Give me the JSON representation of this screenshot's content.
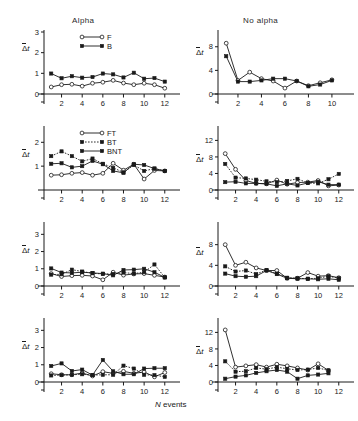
{
  "figure": {
    "column_titles": [
      "Alpha",
      "No alpha"
    ],
    "xaxis_title_symbol": "N",
    "xaxis_title_text": " events",
    "ylabel_delta": "Δ",
    "ylabel_t": "t"
  },
  "legends": {
    "top": [
      {
        "label": "F",
        "marker": "open-circle",
        "line": "solid"
      },
      {
        "label": "B",
        "marker": "filled-square",
        "line": "solid"
      }
    ],
    "second": [
      {
        "label": "FT",
        "marker": "open-circle",
        "line": "solid"
      },
      {
        "label": "BT",
        "marker": "filled-square",
        "line": "dotted"
      },
      {
        "label": "BNT",
        "marker": "filled-square",
        "line": "solid"
      }
    ]
  },
  "chart_data": [
    {
      "id": "alpha-row1",
      "type": "line",
      "title": "Alpha",
      "xlabel": "N events",
      "ylabel": "Δt",
      "xlim": [
        0.3,
        12.7
      ],
      "ylim": [
        0,
        3
      ],
      "xticks": [
        2,
        4,
        6,
        8,
        10,
        12
      ],
      "yticks": [
        0,
        1,
        2,
        3
      ],
      "grid": false,
      "legend": "top",
      "x": [
        1,
        2,
        3,
        4,
        5,
        6,
        7,
        8,
        9,
        10,
        11,
        12
      ],
      "series": [
        {
          "name": "F",
          "marker": "open-circle",
          "line": "solid",
          "values": [
            0.34,
            0.45,
            0.47,
            0.38,
            0.52,
            0.57,
            0.66,
            0.53,
            0.45,
            0.52,
            0.45,
            0.28
          ]
        },
        {
          "name": "B",
          "marker": "filled-square",
          "line": "solid",
          "values": [
            0.99,
            0.76,
            0.86,
            0.79,
            0.82,
            0.99,
            0.95,
            0.8,
            1.03,
            0.74,
            0.77,
            0.6
          ]
        }
      ]
    },
    {
      "id": "alpha-row2",
      "type": "line",
      "xlabel": "N events",
      "ylabel": "Δt",
      "xlim": [
        0.3,
        12.7
      ],
      "ylim": [
        0,
        2.6
      ],
      "xticks": [
        2,
        4,
        6,
        8,
        10,
        12
      ],
      "yticks": [
        1,
        2
      ],
      "grid": false,
      "legend": "second",
      "x": [
        1,
        2,
        3,
        4,
        5,
        6,
        7,
        8,
        9,
        10,
        11,
        12
      ],
      "series": [
        {
          "name": "FT",
          "marker": "open-circle",
          "line": "solid",
          "values": [
            0.62,
            0.64,
            0.7,
            0.73,
            0.62,
            0.7,
            1.12,
            0.83,
            1.08,
            0.46,
            0.82,
            0.8
          ]
        },
        {
          "name": "BT",
          "marker": "filled-square",
          "line": "dotted",
          "values": [
            1.42,
            1.62,
            1.42,
            1.2,
            1.32,
            1.1,
            0.93,
            0.74,
            1.05,
            0.8,
            0.9,
            0.8
          ]
        },
        {
          "name": "BNT",
          "marker": "filled-square",
          "line": "solid",
          "values": [
            1.1,
            1.12,
            0.95,
            1.0,
            1.22,
            1.08,
            0.8,
            0.72,
            1.08,
            1.05,
            0.9,
            0.8
          ]
        }
      ]
    },
    {
      "id": "alpha-row3",
      "type": "line",
      "xlabel": "N events",
      "ylabel": "Δt",
      "xlim": [
        0.3,
        12.7
      ],
      "ylim": [
        0,
        3.6
      ],
      "xticks": [
        2,
        4,
        6,
        8,
        10,
        12
      ],
      "yticks": [
        0,
        1,
        2,
        3
      ],
      "grid": false,
      "legend": null,
      "x": [
        1,
        2,
        3,
        4,
        5,
        6,
        7,
        8,
        9,
        10,
        11,
        12
      ],
      "series": [
        {
          "name": "FT",
          "marker": "open-circle",
          "line": "solid",
          "values": [
            0.72,
            0.55,
            0.6,
            0.62,
            0.58,
            0.36,
            0.8,
            0.63,
            0.7,
            0.72,
            0.62,
            0.52
          ]
        },
        {
          "name": "BT",
          "marker": "filled-square",
          "line": "dotted",
          "values": [
            0.66,
            0.68,
            0.95,
            0.84,
            0.74,
            0.7,
            0.7,
            0.78,
            0.72,
            0.8,
            1.25,
            0.5
          ]
        },
        {
          "name": "BNT",
          "marker": "filled-square",
          "line": "solid",
          "values": [
            1.02,
            0.78,
            0.76,
            0.8,
            0.76,
            0.72,
            0.62,
            0.93,
            0.95,
            1.0,
            0.8,
            0.5
          ]
        }
      ]
    },
    {
      "id": "alpha-row4",
      "type": "line",
      "xlabel": "N events",
      "ylabel": "Δt",
      "xlim": [
        0.3,
        12.7
      ],
      "ylim": [
        0,
        3.6
      ],
      "xticks": [
        2,
        4,
        6,
        8,
        10,
        12
      ],
      "yticks": [
        0,
        1,
        2,
        3
      ],
      "grid": false,
      "legend": null,
      "x": [
        1,
        2,
        3,
        4,
        5,
        6,
        7,
        8,
        9,
        10,
        11,
        12
      ],
      "series": [
        {
          "name": "FT",
          "marker": "open-circle",
          "line": "solid",
          "values": [
            0.48,
            0.42,
            0.42,
            0.52,
            0.35,
            0.6,
            0.5,
            0.62,
            0.5,
            0.58,
            0.3,
            0.55
          ]
        },
        {
          "name": "BT",
          "marker": "filled-square",
          "line": "dotted",
          "values": [
            0.38,
            0.4,
            0.42,
            0.45,
            0.4,
            0.42,
            0.42,
            0.95,
            0.78,
            0.42,
            0.4,
            0.3
          ]
        },
        {
          "name": "BNT",
          "marker": "filled-square",
          "line": "solid",
          "values": [
            0.93,
            1.08,
            0.64,
            0.72,
            0.4,
            1.28,
            0.62,
            0.45,
            0.45,
            0.78,
            0.8,
            0.8
          ]
        }
      ]
    },
    {
      "id": "noalpha-row1",
      "type": "line",
      "title": "No alpha",
      "xlabel": "N events",
      "ylabel": "Δt",
      "xlim": [
        0.3,
        11.2
      ],
      "ylim": [
        0,
        10.5
      ],
      "xticks": [
        2,
        4,
        6,
        8,
        10
      ],
      "yticks": [
        0,
        4,
        8
      ],
      "grid": false,
      "legend": null,
      "x": [
        1,
        2,
        3,
        4,
        5,
        6,
        7,
        8,
        9,
        10
      ],
      "series": [
        {
          "name": "F",
          "marker": "open-circle",
          "line": "solid",
          "values": [
            8.6,
            2.3,
            3.7,
            2.6,
            2.2,
            1.0,
            2.2,
            1.4,
            1.9,
            2.4
          ]
        },
        {
          "name": "B",
          "marker": "filled-square",
          "line": "solid",
          "values": [
            6.4,
            2.1,
            2.1,
            2.3,
            2.6,
            2.6,
            2.2,
            1.3,
            1.6,
            2.3
          ]
        }
      ]
    },
    {
      "id": "noalpha-row2",
      "type": "line",
      "xlabel": "N events",
      "ylabel": "Δt",
      "xlim": [
        0.3,
        12.7
      ],
      "ylim": [
        0,
        15
      ],
      "xticks": [
        2,
        4,
        6,
        8,
        10,
        12
      ],
      "yticks": [
        0,
        4,
        8,
        12
      ],
      "grid": false,
      "legend": null,
      "x": [
        1,
        2,
        3,
        4,
        5,
        6,
        7,
        8,
        9,
        10,
        11,
        12
      ],
      "series": [
        {
          "name": "FT",
          "marker": "open-circle",
          "line": "solid",
          "values": [
            8.8,
            5.0,
            2.3,
            1.6,
            1.5,
            2.4,
            1.4,
            1.8,
            1.9,
            2.3,
            1.0,
            1.2
          ]
        },
        {
          "name": "BT",
          "marker": "filled-square",
          "line": "dotted",
          "values": [
            6.3,
            3.0,
            2.8,
            2.5,
            2.1,
            1.9,
            2.2,
            2.7,
            1.7,
            1.6,
            2.6,
            3.9
          ]
        },
        {
          "name": "BNT",
          "marker": "filled-square",
          "line": "solid",
          "values": [
            1.9,
            2.0,
            1.6,
            1.6,
            1.5,
            1.0,
            1.5,
            1.1,
            1.7,
            2.0,
            1.3,
            1.3
          ]
        }
      ]
    },
    {
      "id": "noalpha-row3",
      "type": "line",
      "xlabel": "N events",
      "ylabel": "Δt",
      "xlim": [
        0.3,
        12.7
      ],
      "ylim": [
        0,
        12
      ],
      "xticks": [
        2,
        4,
        6,
        8,
        10,
        12
      ],
      "yticks": [
        0,
        4,
        8
      ],
      "grid": false,
      "legend": null,
      "x": [
        1,
        2,
        3,
        4,
        5,
        6,
        7,
        8,
        9,
        10,
        11,
        12
      ],
      "series": [
        {
          "name": "FT",
          "marker": "open-circle",
          "line": "solid",
          "values": [
            8.0,
            4.0,
            4.6,
            3.5,
            3.0,
            3.0,
            1.5,
            1.5,
            2.6,
            1.9,
            2.0,
            1.6
          ]
        },
        {
          "name": "BT",
          "marker": "filled-square",
          "line": "dotted",
          "values": [
            3.8,
            2.8,
            3.0,
            2.3,
            3.1,
            2.4,
            1.6,
            1.5,
            1.4,
            1.5,
            1.9,
            1.5
          ]
        },
        {
          "name": "BNT",
          "marker": "filled-square",
          "line": "solid",
          "values": [
            2.4,
            1.9,
            1.8,
            1.9,
            3.0,
            2.3,
            1.5,
            1.4,
            1.4,
            1.3,
            1.4,
            1.2
          ]
        }
      ]
    },
    {
      "id": "noalpha-row4",
      "type": "line",
      "xlabel": "N events",
      "ylabel": "Δt",
      "xlim": [
        0.3,
        12.7
      ],
      "ylim": [
        0,
        15
      ],
      "xticks": [
        2,
        4,
        6,
        8,
        10,
        12
      ],
      "yticks": [
        0,
        4,
        8,
        12
      ],
      "grid": false,
      "legend": null,
      "x": [
        1,
        2,
        3,
        4,
        5,
        6,
        7,
        8,
        9,
        10,
        11
      ],
      "series": [
        {
          "name": "FT",
          "marker": "open-circle",
          "line": "solid",
          "values": [
            12.6,
            3.6,
            3.9,
            4.2,
            3.6,
            4.3,
            3.9,
            3.4,
            2.9,
            4.4,
            2.8
          ]
        },
        {
          "name": "BT",
          "marker": "filled-square",
          "line": "dotted",
          "values": [
            5.0,
            2.5,
            2.6,
            3.4,
            3.1,
            3.6,
            3.2,
            2.9,
            3.0,
            3.4,
            2.8
          ]
        },
        {
          "name": "BNT",
          "marker": "filled-square",
          "line": "solid",
          "values": [
            0.8,
            1.3,
            1.6,
            2.2,
            2.6,
            2.9,
            2.5,
            0.8,
            1.6,
            1.8,
            2.1
          ]
        }
      ]
    }
  ]
}
